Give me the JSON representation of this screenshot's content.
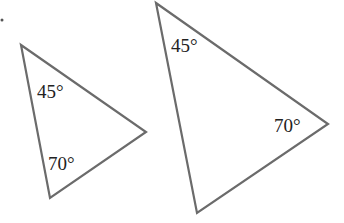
{
  "diagram": {
    "stroke_color": "#6b6b6b",
    "text_color": "#222222",
    "triangles": [
      {
        "name": "small-triangle",
        "vertices": [
          [
            21,
            45
          ],
          [
            146,
            132
          ],
          [
            50,
            198
          ]
        ],
        "angles": [
          {
            "label": "45°",
            "x": 37,
            "y": 98
          },
          {
            "label": "70°",
            "x": 48,
            "y": 170
          }
        ]
      },
      {
        "name": "large-triangle",
        "vertices": [
          [
            156,
            3
          ],
          [
            328,
            124
          ],
          [
            197,
            213
          ]
        ],
        "angles": [
          {
            "label": "45°",
            "x": 171,
            "y": 52
          },
          {
            "label": "70°",
            "x": 274,
            "y": 132
          }
        ]
      }
    ]
  }
}
